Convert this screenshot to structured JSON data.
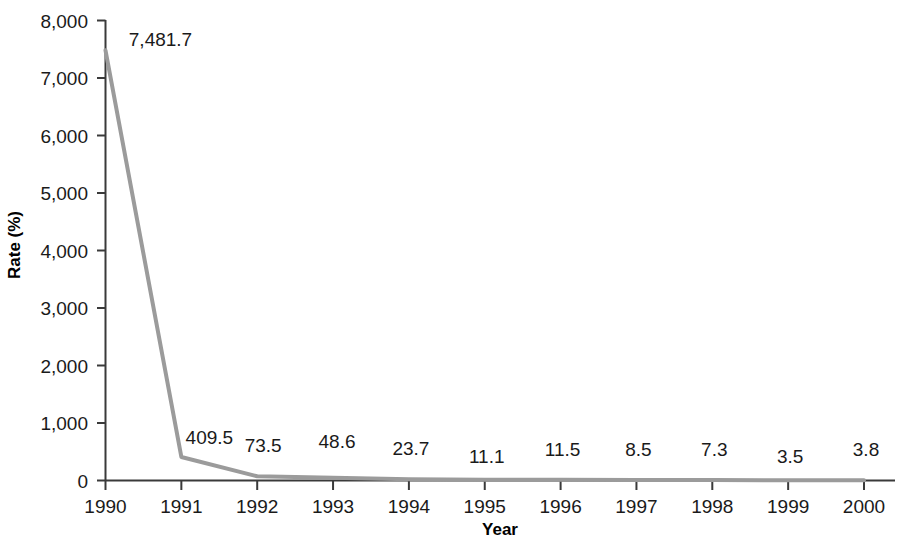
{
  "chart_data": {
    "type": "line",
    "title": "",
    "xlabel": "Year",
    "ylabel": "Rate (%)",
    "categories": [
      "1990",
      "1991",
      "1992",
      "1993",
      "1994",
      "1995",
      "1996",
      "1997",
      "1998",
      "1999",
      "2000"
    ],
    "values": [
      7481.7,
      409.5,
      73.5,
      48.6,
      23.7,
      11.1,
      11.5,
      8.5,
      7.3,
      3.5,
      3.8
    ],
    "point_labels": [
      "7,481.7",
      "409.5",
      "73.5",
      "48.6",
      "23.7",
      "11.1",
      "11.5",
      "8.5",
      "7.3",
      "3.5",
      "3.8"
    ],
    "ylim": [
      0,
      8000
    ],
    "yticks": [
      0,
      1000,
      2000,
      3000,
      4000,
      5000,
      6000,
      7000,
      8000
    ],
    "ytick_labels": [
      "0",
      "1,000",
      "2,000",
      "3,000",
      "4,000",
      "5,000",
      "6,000",
      "7,000",
      "8,000"
    ],
    "grid": false,
    "legend": "none",
    "series": [
      {
        "name": "Rate",
        "color": "#9b9b9b",
        "values": [
          7481.7,
          409.5,
          73.5,
          48.6,
          23.7,
          11.1,
          11.5,
          8.5,
          7.3,
          3.5,
          3.8
        ]
      }
    ],
    "colors": {
      "line": "#9b9b9b",
      "axis": "#3a3a3a",
      "text": "#1a1a1a",
      "background": "#ffffff"
    }
  }
}
